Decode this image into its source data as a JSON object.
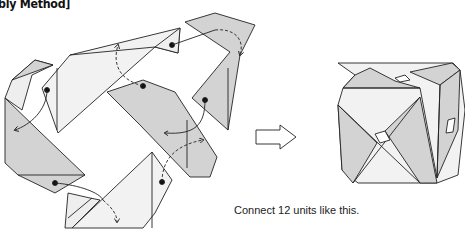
{
  "header": {
    "title": "bly Method]"
  },
  "caption": "Connect 12 units like this.",
  "colors": {
    "unit_gray": "#d3d3d3",
    "unit_light": "#eeeeee",
    "stroke": "#222222"
  },
  "diagram": {
    "left_panel": "12 modular origami units with connection arrows",
    "arrow": "hollow right arrow",
    "right_panel": "assembled cuboctahedron-like cube"
  }
}
